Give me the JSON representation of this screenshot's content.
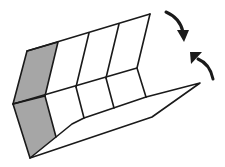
{
  "diagram": {
    "type": "folding-instruction",
    "colors": {
      "line": "#1a1a1a",
      "shaded_panel": "#a6a6a6",
      "paper": "#ffffff"
    },
    "arrows": [
      {
        "name": "fold-down-arrow",
        "direction": "clockwise-down"
      },
      {
        "name": "fold-up-arrow",
        "direction": "counterclockwise-up"
      }
    ],
    "panels": {
      "upper_columns": 4,
      "lower_columns": 3
    }
  }
}
